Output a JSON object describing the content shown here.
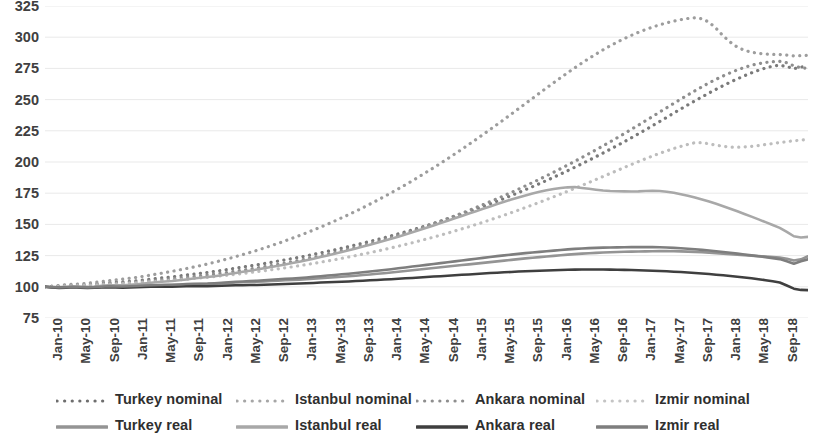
{
  "chart_data": {
    "type": "line",
    "title": "",
    "xlabel": "",
    "ylabel": "",
    "ylim": [
      75,
      325
    ],
    "ytick_values": [
      325,
      300,
      275,
      250,
      225,
      200,
      175,
      150,
      125,
      100,
      75
    ],
    "grid": true,
    "legend_position": "bottom",
    "x_start": "Jan-10",
    "x_end": "Jan-19",
    "x_tick_interval_months": 4,
    "tick_labels": [
      "Jan-10",
      "May-10",
      "Sep-10",
      "Jan-11",
      "May-11",
      "Sep-11",
      "Jan-12",
      "May-12",
      "Sep-12",
      "Jan-13",
      "May-13",
      "Sep-13",
      "Jan-14",
      "May-14",
      "Sep-14",
      "Jan-15",
      "May-15",
      "Sep-15",
      "Jan-16",
      "May-16",
      "Sep-16",
      "Jan-17",
      "May-17",
      "Sep-17",
      "Jan-18",
      "May-18",
      "Sep-18",
      "Jan-19"
    ],
    "series": [
      {
        "name": "Turkey nominal",
        "style": "dotted",
        "color": "#7a7a7a",
        "values": [
          100.0,
          100.3,
          100.7,
          101.0,
          101.3,
          101.5,
          101.8,
          102.2,
          102.8,
          103.3,
          103.7,
          104.0,
          104.4,
          104.9,
          105.5,
          106.1,
          106.8,
          107.4,
          108.0,
          108.7,
          109.4,
          110.1,
          110.8,
          111.5,
          112.3,
          113.1,
          114.0,
          114.9,
          115.8,
          116.7,
          117.6,
          118.6,
          119.6,
          120.6,
          121.6,
          122.6,
          123.7,
          124.8,
          126.0,
          127.2,
          128.4,
          129.6,
          130.9,
          132.2,
          133.6,
          135.0,
          136.4,
          137.8,
          139.3,
          140.8,
          142.4,
          144.0,
          145.6,
          147.3,
          149.0,
          150.8,
          152.6,
          154.4,
          156.3,
          158.2,
          160.2,
          162.2,
          164.3,
          166.4,
          168.6,
          170.8,
          173.1,
          175.4,
          177.8,
          180.2,
          182.7,
          185.2,
          187.8,
          190.4,
          193.1,
          195.8,
          198.6,
          201.4,
          204.3,
          207.2,
          210.2,
          213.2,
          216.3,
          219.4,
          222.6,
          225.8,
          229.1,
          232.4,
          235.8,
          239.2,
          242.5,
          245.8,
          249.0,
          252.2,
          255.3,
          258.3,
          261.2,
          264.0,
          266.6,
          269.1,
          271.4,
          273.5,
          275.3,
          276.8,
          277.5,
          276.5,
          274.8,
          276.0,
          277.0
        ]
      },
      {
        "name": "Istanbul nominal",
        "style": "dotted",
        "color": "#9d9d9d",
        "values": [
          100.0,
          100.5,
          101.1,
          101.6,
          102.0,
          102.4,
          102.9,
          103.5,
          104.2,
          104.9,
          105.5,
          106.1,
          106.8,
          107.6,
          108.5,
          109.4,
          110.4,
          111.4,
          112.4,
          113.5,
          114.6,
          115.8,
          117.0,
          118.3,
          119.7,
          121.1,
          122.6,
          124.2,
          125.8,
          127.5,
          129.2,
          131.0,
          132.9,
          134.8,
          136.8,
          138.9,
          141.0,
          143.2,
          145.5,
          147.8,
          150.2,
          152.7,
          155.3,
          157.9,
          160.6,
          163.4,
          166.3,
          169.2,
          172.2,
          175.3,
          178.5,
          181.7,
          185.0,
          188.4,
          191.9,
          195.4,
          199.0,
          202.7,
          206.4,
          210.2,
          214.1,
          218.0,
          222.0,
          226.0,
          230.1,
          234.2,
          238.4,
          242.6,
          246.8,
          251.0,
          255.2,
          259.4,
          263.5,
          267.6,
          271.6,
          275.5,
          279.3,
          283.0,
          286.5,
          289.9,
          293.1,
          296.1,
          298.9,
          301.5,
          303.9,
          306.1,
          308.1,
          309.9,
          311.5,
          312.9,
          314.1,
          315.0,
          315.5,
          314.8,
          312.0,
          307.0,
          301.0,
          296.0,
          292.0,
          289.5,
          288.0,
          287.0,
          286.5,
          286.2,
          286.0,
          285.6,
          285.0,
          285.2,
          285.5
        ]
      },
      {
        "name": "Ankara nominal",
        "style": "dotted",
        "color": "#8e8e8e",
        "values": [
          100.0,
          100.2,
          100.5,
          100.7,
          100.9,
          101.1,
          101.4,
          101.7,
          102.1,
          102.5,
          102.8,
          103.1,
          103.5,
          103.9,
          104.4,
          104.9,
          105.4,
          105.9,
          106.4,
          107.0,
          107.6,
          108.2,
          108.8,
          109.5,
          110.2,
          110.9,
          111.7,
          112.5,
          113.3,
          114.2,
          115.1,
          116.0,
          117.0,
          118.0,
          119.0,
          120.1,
          121.2,
          122.4,
          123.6,
          124.8,
          126.1,
          127.4,
          128.8,
          130.2,
          131.6,
          133.1,
          134.6,
          136.2,
          137.8,
          139.5,
          141.2,
          143.0,
          144.8,
          146.7,
          148.6,
          150.6,
          152.6,
          154.7,
          156.8,
          159.0,
          161.2,
          163.5,
          165.8,
          168.2,
          170.6,
          173.1,
          175.6,
          178.2,
          180.8,
          183.5,
          186.2,
          189.0,
          191.8,
          194.7,
          197.6,
          200.6,
          203.6,
          206.7,
          209.8,
          213.0,
          216.2,
          219.5,
          222.8,
          226.2,
          229.6,
          233.0,
          236.5,
          240.0,
          243.5,
          247.0,
          250.4,
          253.8,
          257.1,
          260.3,
          263.4,
          266.3,
          269.0,
          271.5,
          273.8,
          275.8,
          277.5,
          278.8,
          279.8,
          280.4,
          280.6,
          279.5,
          277.0,
          275.5,
          275.0
        ]
      },
      {
        "name": "Izmir nominal",
        "style": "dotted",
        "color": "#bdbdbd",
        "values": [
          100.0,
          100.2,
          100.4,
          100.6,
          100.8,
          101.0,
          101.2,
          101.5,
          101.8,
          102.1,
          102.3,
          102.6,
          102.9,
          103.2,
          103.6,
          104.0,
          104.4,
          104.8,
          105.2,
          105.6,
          106.1,
          106.6,
          107.1,
          107.6,
          108.2,
          108.8,
          109.4,
          110.0,
          110.7,
          111.4,
          112.1,
          112.8,
          113.6,
          114.4,
          115.2,
          116.0,
          116.9,
          117.8,
          118.7,
          119.7,
          120.7,
          121.7,
          122.8,
          123.9,
          125.0,
          126.2,
          127.4,
          128.6,
          129.9,
          131.2,
          132.5,
          133.9,
          135.3,
          136.8,
          138.3,
          139.8,
          141.4,
          143.0,
          144.7,
          146.4,
          148.1,
          149.9,
          151.7,
          153.6,
          155.5,
          157.4,
          159.4,
          161.4,
          163.5,
          165.6,
          167.7,
          169.9,
          172.1,
          174.3,
          176.6,
          178.9,
          181.2,
          183.6,
          186.0,
          188.4,
          190.8,
          193.2,
          195.6,
          198.0,
          200.3,
          202.6,
          204.8,
          206.9,
          208.9,
          210.8,
          212.5,
          214.1,
          215.5,
          215.5,
          214.5,
          213.5,
          212.5,
          212.0,
          211.8,
          212.0,
          212.5,
          213.2,
          214.0,
          214.8,
          215.6,
          216.3,
          217.0,
          217.5,
          218.0
        ]
      },
      {
        "name": "Turkey real",
        "style": "solid",
        "color": "#949494",
        "values": [
          100.0,
          99.6,
          99.3,
          99.5,
          99.8,
          99.6,
          99.4,
          99.6,
          100.0,
          100.2,
          100.1,
          100.0,
          100.2,
          100.4,
          100.7,
          101.0,
          101.2,
          101.3,
          101.4,
          101.6,
          101.9,
          102.1,
          102.2,
          102.3,
          102.5,
          102.8,
          103.1,
          103.4,
          103.6,
          103.8,
          104.0,
          104.3,
          104.6,
          104.9,
          105.2,
          105.4,
          105.7,
          106.0,
          106.4,
          106.8,
          107.2,
          107.6,
          108.0,
          108.4,
          108.9,
          109.4,
          109.9,
          110.4,
          110.9,
          111.4,
          112.0,
          112.6,
          113.2,
          113.8,
          114.4,
          115.0,
          115.6,
          116.2,
          116.8,
          117.4,
          118.0,
          118.6,
          119.2,
          119.8,
          120.4,
          121.0,
          121.6,
          122.2,
          122.8,
          123.3,
          123.8,
          124.3,
          124.8,
          125.3,
          125.8,
          126.2,
          126.6,
          126.9,
          127.2,
          127.5,
          127.7,
          127.9,
          128.1,
          128.2,
          128.3,
          128.4,
          128.5,
          128.6,
          128.6,
          128.5,
          128.4,
          128.2,
          128.0,
          127.7,
          127.4,
          127.0,
          126.6,
          126.2,
          125.8,
          125.4,
          125.0,
          124.6,
          124.2,
          123.8,
          123.4,
          122.5,
          121.0,
          122.0,
          124.5
        ]
      },
      {
        "name": "Istanbul real",
        "style": "solid",
        "color": "#a8a8a8",
        "values": [
          100.0,
          99.8,
          99.7,
          99.9,
          100.2,
          100.1,
          100.0,
          100.3,
          100.8,
          101.2,
          101.3,
          101.3,
          101.6,
          102.0,
          102.6,
          103.2,
          103.8,
          104.2,
          104.6,
          105.2,
          105.9,
          106.6,
          107.2,
          107.8,
          108.5,
          109.3,
          110.2,
          111.1,
          112.0,
          112.9,
          113.8,
          114.8,
          115.8,
          116.8,
          117.9,
          119.0,
          120.1,
          121.3,
          122.5,
          123.8,
          125.1,
          126.4,
          127.8,
          129.2,
          130.7,
          132.2,
          133.7,
          135.3,
          136.9,
          138.5,
          140.2,
          141.9,
          143.7,
          145.5,
          147.3,
          149.2,
          151.1,
          153.0,
          154.9,
          156.8,
          158.7,
          160.6,
          162.5,
          164.4,
          166.3,
          168.1,
          169.9,
          171.6,
          173.2,
          174.7,
          176.1,
          177.3,
          178.3,
          179.1,
          179.7,
          180.0,
          179.2,
          178.5,
          177.8,
          177.2,
          176.8,
          176.6,
          176.5,
          176.4,
          176.5,
          176.8,
          177.0,
          176.8,
          176.2,
          175.3,
          174.2,
          173.0,
          171.6,
          170.0,
          168.3,
          166.5,
          164.6,
          162.6,
          160.5,
          158.4,
          156.2,
          154.0,
          151.8,
          149.5,
          147.2,
          144.0,
          140.5,
          139.5,
          140.0
        ]
      },
      {
        "name": "Ankara real",
        "style": "solid",
        "color": "#3f3f3f",
        "values": [
          100.0,
          99.5,
          99.1,
          99.3,
          99.6,
          99.3,
          99.0,
          99.2,
          99.5,
          99.7,
          99.5,
          99.3,
          99.4,
          99.6,
          99.8,
          100.0,
          100.1,
          100.1,
          100.1,
          100.2,
          100.4,
          100.5,
          100.5,
          100.5,
          100.6,
          100.8,
          101.0,
          101.2,
          101.3,
          101.4,
          101.5,
          101.7,
          101.9,
          102.1,
          102.3,
          102.4,
          102.6,
          102.8,
          103.1,
          103.4,
          103.6,
          103.8,
          104.0,
          104.3,
          104.6,
          104.9,
          105.2,
          105.5,
          105.8,
          106.1,
          106.4,
          106.8,
          107.1,
          107.5,
          107.8,
          108.2,
          108.5,
          108.9,
          109.2,
          109.6,
          109.9,
          110.3,
          110.6,
          111.0,
          111.3,
          111.6,
          111.9,
          112.2,
          112.5,
          112.7,
          112.9,
          113.1,
          113.3,
          113.5,
          113.7,
          113.8,
          113.9,
          113.9,
          113.9,
          113.9,
          113.8,
          113.7,
          113.6,
          113.5,
          113.3,
          113.1,
          112.9,
          112.7,
          112.4,
          112.1,
          111.8,
          111.4,
          111.0,
          110.6,
          110.2,
          109.7,
          109.2,
          108.7,
          108.1,
          107.5,
          106.8,
          106.1,
          105.3,
          104.4,
          103.4,
          101.0,
          98.5,
          97.5,
          97.3
        ]
      },
      {
        "name": "Izmir real",
        "style": "solid",
        "color": "#7e7e7e",
        "values": [
          100.0,
          99.7,
          99.4,
          99.6,
          99.9,
          99.7,
          99.5,
          99.7,
          100.1,
          100.4,
          100.3,
          100.2,
          100.4,
          100.7,
          101.0,
          101.3,
          101.5,
          101.6,
          101.7,
          101.9,
          102.2,
          102.4,
          102.5,
          102.6,
          102.9,
          103.2,
          103.6,
          104.0,
          104.3,
          104.6,
          104.9,
          105.2,
          105.6,
          106.0,
          106.4,
          106.7,
          107.1,
          107.5,
          108.0,
          108.5,
          109.0,
          109.5,
          110.0,
          110.5,
          111.1,
          111.7,
          112.3,
          112.9,
          113.5,
          114.1,
          114.8,
          115.5,
          116.2,
          116.9,
          117.6,
          118.3,
          119.0,
          119.7,
          120.4,
          121.1,
          121.8,
          122.5,
          123.2,
          123.9,
          124.6,
          125.2,
          125.8,
          126.4,
          127.0,
          127.5,
          128.0,
          128.5,
          129.0,
          129.5,
          130.0,
          130.4,
          130.7,
          131.0,
          131.2,
          131.4,
          131.5,
          131.6,
          131.7,
          131.8,
          131.8,
          131.8,
          131.8,
          131.7,
          131.5,
          131.2,
          130.9,
          130.5,
          130.1,
          129.6,
          129.1,
          128.5,
          127.9,
          127.3,
          126.6,
          125.9,
          125.2,
          124.5,
          123.8,
          123.0,
          122.2,
          120.5,
          118.5,
          120.5,
          122.0
        ]
      }
    ]
  },
  "legend": {
    "rows": [
      [
        {
          "label": "Turkey nominal",
          "style": "dotted",
          "color": "#6e6e6e"
        },
        {
          "label": "Istanbul nominal",
          "style": "dotted",
          "color": "#a6a6a6"
        },
        {
          "label": "Ankara nominal",
          "style": "dotted",
          "color": "#8e8e8e"
        },
        {
          "label": "Izmir nominal",
          "style": "dotted",
          "color": "#c4c4c4"
        }
      ],
      [
        {
          "label": "Turkey real",
          "style": "solid",
          "color": "#949494"
        },
        {
          "label": "Istanbul real",
          "style": "solid",
          "color": "#a8a8a8"
        },
        {
          "label": "Ankara real",
          "style": "solid",
          "color": "#3f3f3f"
        },
        {
          "label": "Izmir real",
          "style": "solid",
          "color": "#7e7e7e"
        }
      ]
    ]
  }
}
